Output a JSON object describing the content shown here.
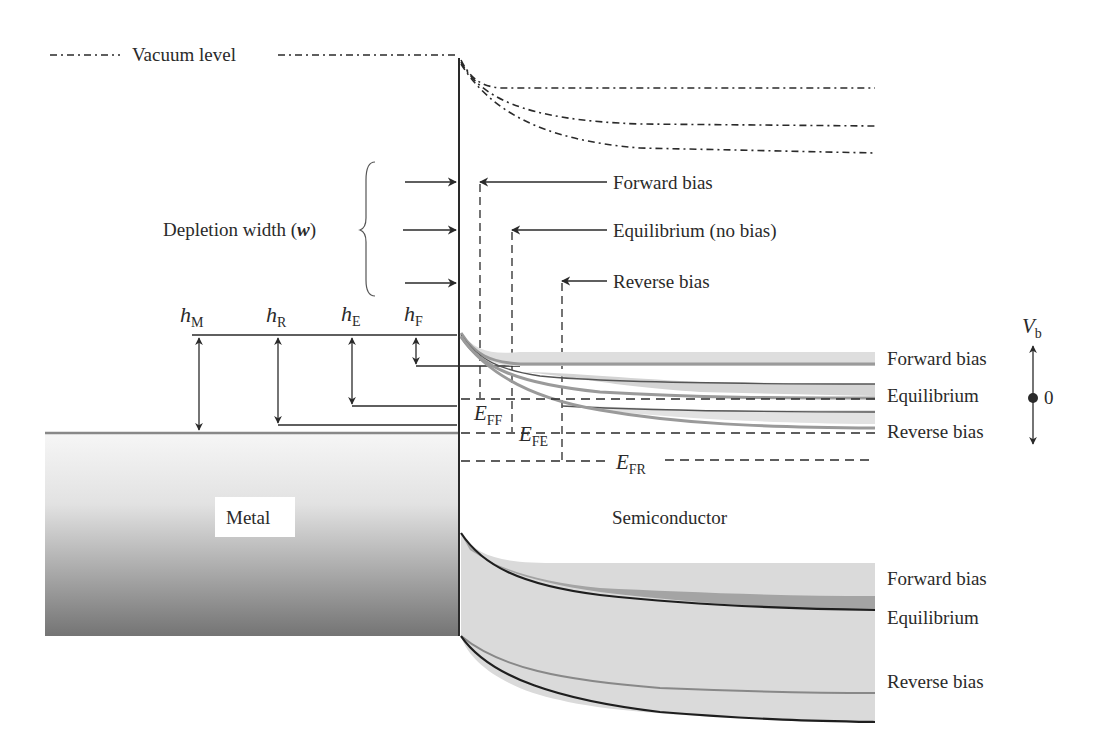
{
  "diagram": {
    "type": "band-diagram",
    "vacuum_level_label": "Vacuum level",
    "depletion_width_label": "Depletion width (",
    "depletion_width_symbol": "w",
    "depletion_width_close": ")",
    "depletion_callouts": [
      {
        "label": "Forward bias"
      },
      {
        "label": "Equilibrium (no bias)"
      },
      {
        "label": "Reverse bias"
      }
    ],
    "barrier_heights": [
      {
        "base": "h",
        "sub": "M"
      },
      {
        "base": "h",
        "sub": "R"
      },
      {
        "base": "h",
        "sub": "E"
      },
      {
        "base": "h",
        "sub": "F"
      }
    ],
    "fermi_levels": [
      {
        "base": "E",
        "sub": "FF"
      },
      {
        "base": "E",
        "sub": "FE"
      },
      {
        "base": "E",
        "sub": "FR"
      }
    ],
    "conduction_band_labels": [
      "Forward bias",
      "Equilibrium",
      "Reverse bias"
    ],
    "valence_band_labels": [
      "Forward bias",
      "Equilibrium",
      "Reverse bias"
    ],
    "bias_axis": {
      "symbol": "V",
      "sub": "b",
      "zero_label": "0"
    },
    "metal_label": "Metal",
    "semiconductor_label": "Semiconductor",
    "colors": {
      "line": "#2a2a2a",
      "band_gray": "#9a9a9a",
      "band_fill_light": "#dcdcdc",
      "band_fill_mid": "#a8a8a8",
      "metal_top": "#f4f4f4",
      "metal_bottom": "#777777"
    }
  }
}
